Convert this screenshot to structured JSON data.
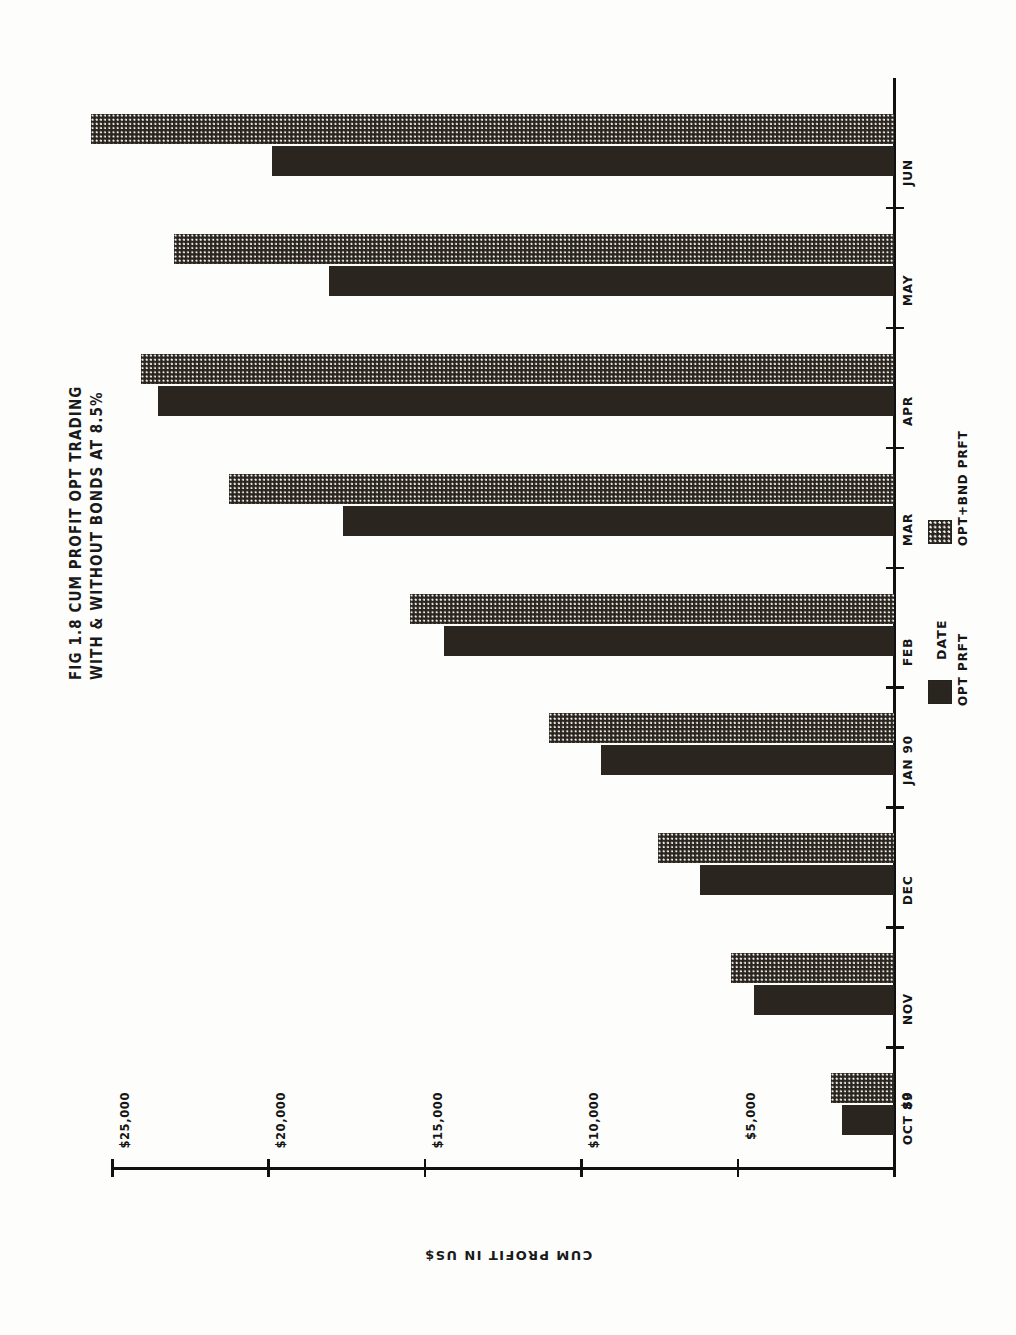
{
  "figure": {
    "title_lines": [
      "FIG 1.8 CUM PROFIT OPT TRADING",
      "WITH & WITHOUT BONDS AT 8.5%"
    ],
    "orientation_note": "rotated-90-ccw"
  },
  "legend": {
    "entries": [
      {
        "label": "OPT PRFT",
        "swatch": "solid-black",
        "color": "#2b2520"
      },
      {
        "label": "OPT+BND PRFT",
        "swatch": "dotted-halftone",
        "color": "#2b2520"
      }
    ]
  },
  "axes": {
    "value_axis": {
      "title": "CUM PROFIT IN US$",
      "tick_labels": [
        "$25,000",
        "$20,000",
        "$15,000",
        "$10,000",
        "$5,000",
        "$0"
      ],
      "tick_values": [
        25000,
        20000,
        15000,
        10000,
        5000,
        0
      ],
      "min": 0,
      "max": 25000
    },
    "category_axis": {
      "title": "DATE",
      "tick_labels": [
        "JUN",
        "MAY",
        "APR",
        "MAR",
        "FEB",
        "JAN 90",
        "DEC",
        "NOV",
        "OCT 89"
      ]
    }
  },
  "chart_data": {
    "type": "bar",
    "orientation": "horizontal",
    "title": "FIG 1.8 CUM PROFIT OPT TRADING WITH & WITHOUT BONDS AT 8.5%",
    "xlabel": "DATE",
    "ylabel": "CUM PROFIT IN US$",
    "ylim": [
      0,
      25000
    ],
    "grid": false,
    "legend_position": "bottom-right",
    "categories": [
      "OCT 89",
      "NOV",
      "DEC",
      "JAN 90",
      "FEB",
      "MAR",
      "APR",
      "MAY",
      "JUN"
    ],
    "series": [
      {
        "name": "OPT PRFT",
        "fill": "solid-black",
        "color": "#2b2520",
        "values": [
          1670,
          4470,
          6200,
          9370,
          14400,
          17600,
          23530,
          18070,
          19900
        ]
      },
      {
        "name": "OPT+BND PRFT",
        "fill": "dotted-halftone",
        "color": "#2b2520",
        "values": [
          2030,
          5200,
          7530,
          11030,
          15470,
          21270,
          24070,
          23030,
          25670
        ]
      }
    ]
  }
}
